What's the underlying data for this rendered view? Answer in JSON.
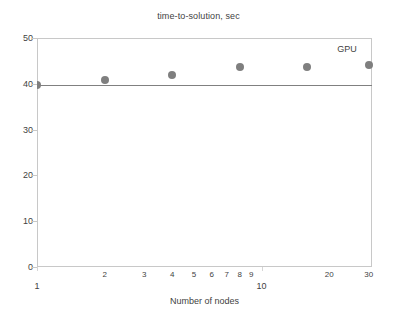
{
  "chart_data": {
    "type": "scatter",
    "title": "time-to-solution, sec",
    "xlabel": "Number of nodes",
    "ylabel": "",
    "x_scale": "log",
    "y_scale": "linear",
    "xlim": [
      1,
      31
    ],
    "ylim": [
      0,
      50
    ],
    "grid": false,
    "legend_position": "top-right-inline",
    "series": [
      {
        "name": "GPU",
        "color": "#7f7f7f",
        "marker": "circle",
        "x": [
          1,
          2,
          4,
          8,
          16,
          30
        ],
        "values": [
          39.7,
          40.8,
          41.9,
          43.6,
          43.7,
          44.2
        ]
      }
    ],
    "annotations": [
      {
        "text": "GPU",
        "x": 24,
        "y": 47.5
      }
    ],
    "reference_line": {
      "orientation": "horizontal",
      "y": 39.7,
      "color": "#808080"
    },
    "y_ticks": [
      {
        "value": 0,
        "label": "0"
      },
      {
        "value": 10,
        "label": "10"
      },
      {
        "value": 20,
        "label": "20"
      },
      {
        "value": 30,
        "label": "30"
      },
      {
        "value": 40,
        "label": "40"
      },
      {
        "value": 50,
        "label": "50"
      }
    ],
    "x_ticks": [
      {
        "value": 1,
        "label": "1",
        "major": true
      },
      {
        "value": 2,
        "label": "2",
        "major": false
      },
      {
        "value": 3,
        "label": "3",
        "major": false
      },
      {
        "value": 4,
        "label": "4",
        "major": false
      },
      {
        "value": 5,
        "label": "5",
        "major": false
      },
      {
        "value": 6,
        "label": "6",
        "major": false
      },
      {
        "value": 7,
        "label": "7",
        "major": false
      },
      {
        "value": 8,
        "label": "8",
        "major": false
      },
      {
        "value": 9,
        "label": "9",
        "major": false
      },
      {
        "value": 10,
        "label": "10",
        "major": true
      },
      {
        "value": 20,
        "label": "20",
        "major": false
      },
      {
        "value": 30,
        "label": "30",
        "major": false
      }
    ]
  }
}
